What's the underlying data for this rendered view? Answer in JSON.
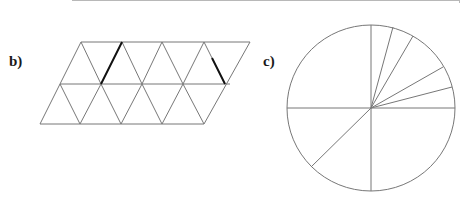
{
  "figure": {
    "parts": [
      {
        "label": "b)",
        "kind": "triangle-tessellation",
        "rows": 2,
        "description": "Parallelogram tiled by equilateral triangles (2 rows), with two edges drawn bold",
        "line_color": "#777777",
        "bold_color": "#111111"
      },
      {
        "label": "c)",
        "kind": "circle-sectors",
        "description": "Circle divided by radii into sectors; axes plus four extra radii in upper-right quadrant and one in lower-left",
        "radii_angles_deg": [
          0,
          12,
          28,
          63,
          75,
          90,
          180,
          215,
          270
        ],
        "line_color": "#777777"
      }
    ]
  }
}
